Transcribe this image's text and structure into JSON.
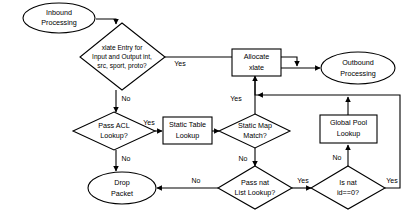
{
  "diagram": {
    "colors": {
      "background": "#ffffff",
      "stroke": "#000000",
      "fill": "#ffffff",
      "text": "#000000"
    },
    "nodes": {
      "inbound_processing": {
        "shape": "ellipse",
        "line1": "Inbound",
        "line2": "Processing"
      },
      "xlate_entry": {
        "shape": "diamond",
        "line1": "xlate Entry for",
        "line2": "Input and Output int,",
        "line3": "src, sport, proto?"
      },
      "allocate_xlate": {
        "shape": "rect",
        "line1": "Allocate",
        "line2": "xlate"
      },
      "outbound_processing": {
        "shape": "ellipse",
        "line1": "Outbound",
        "line2": "Processing"
      },
      "pass_acl_lookup": {
        "shape": "diamond",
        "line1": "Pass ACL",
        "line2": "Lookup?"
      },
      "static_table_lookup": {
        "shape": "rect",
        "line1": "Static Table",
        "line2": "Lookup"
      },
      "static_map_match": {
        "shape": "diamond",
        "line1": "Static Map",
        "line2": "Match?"
      },
      "global_pool_lookup": {
        "shape": "rect",
        "line1": "Global Pool",
        "line2": "Lookup"
      },
      "drop_packet": {
        "shape": "ellipse",
        "line1": "Drop",
        "line2": "Packet"
      },
      "pass_nat_list_lookup": {
        "shape": "diamond",
        "line1": "Pass nat",
        "line2": "List Lookup?"
      },
      "is_nat_id_zero": {
        "shape": "diamond",
        "line1": "Is nat",
        "line2": "id==0?"
      }
    },
    "edge_labels": {
      "xlate_yes": "Yes",
      "xlate_no": "No",
      "acl_yes": "Yes",
      "acl_no": "No",
      "static_map_yes": "Yes",
      "static_map_no": "No",
      "nat_list_no": "No",
      "nat_list_yes": "Yes",
      "nat_id_no": "No",
      "nat_id_yes": "Yes"
    }
  }
}
